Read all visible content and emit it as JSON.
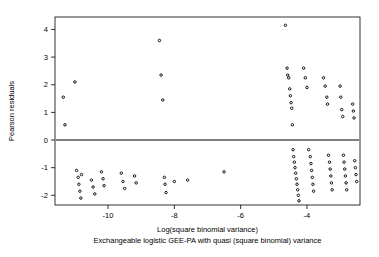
{
  "chart_data": {
    "type": "scatter",
    "title": "",
    "subtitle": "Exchangeable logistic GEE-PA with quasi (square binomial) variance",
    "xlabel": "Log(square binomial variance)",
    "ylabel": "Pearson residuals",
    "xlim": [
      -11.6,
      -2.4
    ],
    "ylim": [
      -2.35,
      4.45
    ],
    "xticks": [
      -10,
      -8,
      -6,
      -4
    ],
    "xticklabels": [
      "-10",
      "-8",
      "-6",
      "-4"
    ],
    "yticks": [
      -2,
      -1,
      0,
      1,
      2,
      3,
      4
    ],
    "yticklabels": [
      "-2",
      "-1",
      "0",
      "1",
      "2",
      "3",
      "4"
    ],
    "grid": false,
    "box": true,
    "reference_line": {
      "type": "horizontal",
      "y": 0,
      "color": "#000000"
    },
    "marker": {
      "shape": "circle",
      "size": 2,
      "color": "#000000"
    },
    "points": [
      [
        -11.35,
        1.55
      ],
      [
        -11.3,
        0.55
      ],
      [
        -11.0,
        2.1
      ],
      [
        -10.95,
        -1.1
      ],
      [
        -10.9,
        -1.35
      ],
      [
        -10.88,
        -1.6
      ],
      [
        -10.85,
        -1.85
      ],
      [
        -10.82,
        -2.1
      ],
      [
        -10.8,
        -1.25
      ],
      [
        -10.5,
        -1.45
      ],
      [
        -10.45,
        -1.7
      ],
      [
        -10.4,
        -1.95
      ],
      [
        -10.2,
        -1.15
      ],
      [
        -10.15,
        -1.4
      ],
      [
        -10.12,
        -1.65
      ],
      [
        -9.6,
        -1.2
      ],
      [
        -9.55,
        -1.5
      ],
      [
        -9.5,
        -1.75
      ],
      [
        -9.2,
        -1.3
      ],
      [
        -9.15,
        -1.55
      ],
      [
        -8.45,
        3.6
      ],
      [
        -8.4,
        2.35
      ],
      [
        -8.35,
        1.45
      ],
      [
        -8.3,
        -1.35
      ],
      [
        -8.28,
        -1.6
      ],
      [
        -8.25,
        -1.9
      ],
      [
        -8.0,
        -1.5
      ],
      [
        -7.6,
        -1.45
      ],
      [
        -6.5,
        -1.15
      ],
      [
        -4.65,
        4.15
      ],
      [
        -4.6,
        2.6
      ],
      [
        -4.58,
        2.35
      ],
      [
        -4.55,
        2.25
      ],
      [
        -4.52,
        1.85
      ],
      [
        -4.5,
        1.6
      ],
      [
        -4.48,
        1.35
      ],
      [
        -4.46,
        1.15
      ],
      [
        -4.44,
        0.55
      ],
      [
        -4.42,
        -0.35
      ],
      [
        -4.4,
        -0.6
      ],
      [
        -4.38,
        -0.8
      ],
      [
        -4.36,
        -1.0
      ],
      [
        -4.34,
        -1.2
      ],
      [
        -4.32,
        -1.4
      ],
      [
        -4.3,
        -1.6
      ],
      [
        -4.28,
        -1.8
      ],
      [
        -4.26,
        -2.0
      ],
      [
        -4.24,
        -2.2
      ],
      [
        -4.1,
        2.6
      ],
      [
        -4.05,
        2.25
      ],
      [
        -4.0,
        1.9
      ],
      [
        -3.95,
        -0.35
      ],
      [
        -3.9,
        -0.6
      ],
      [
        -3.88,
        -0.85
      ],
      [
        -3.86,
        -1.1
      ],
      [
        -3.84,
        -1.35
      ],
      [
        -3.82,
        -1.6
      ],
      [
        -3.8,
        -1.85
      ],
      [
        -3.5,
        2.25
      ],
      [
        -3.45,
        1.95
      ],
      [
        -3.4,
        1.55
      ],
      [
        -3.38,
        1.3
      ],
      [
        -3.35,
        -0.55
      ],
      [
        -3.32,
        -0.8
      ],
      [
        -3.3,
        -1.05
      ],
      [
        -3.28,
        -1.3
      ],
      [
        -3.26,
        -1.55
      ],
      [
        -3.24,
        -1.8
      ],
      [
        -3.0,
        1.95
      ],
      [
        -2.98,
        1.55
      ],
      [
        -2.95,
        1.1
      ],
      [
        -2.92,
        0.85
      ],
      [
        -2.9,
        -0.55
      ],
      [
        -2.88,
        -0.8
      ],
      [
        -2.86,
        -1.05
      ],
      [
        -2.84,
        -1.3
      ],
      [
        -2.82,
        -1.55
      ],
      [
        -2.8,
        -1.8
      ],
      [
        -2.62,
        1.3
      ],
      [
        -2.6,
        1.05
      ],
      [
        -2.58,
        0.8
      ],
      [
        -2.56,
        -0.75
      ],
      [
        -2.54,
        -1.0
      ],
      [
        -2.52,
        -1.25
      ],
      [
        -2.5,
        -1.5
      ]
    ]
  }
}
